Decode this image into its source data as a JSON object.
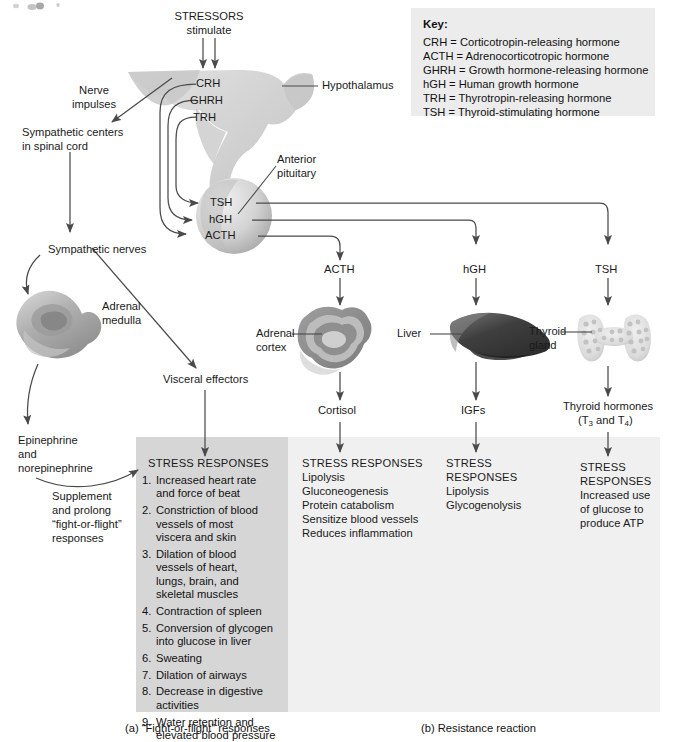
{
  "figure": {
    "title_hidden": "",
    "key": {
      "heading": "Key:",
      "entries": [
        "CRH = Corticotropin-releasing hormone",
        "ACTH = Adrenocorticotropic hormone",
        "GHRH = Growth hormone-releasing hormone",
        "hGH = Human growth hormone",
        "TRH = Thyrotropin-releasing hormone",
        "TSH = Thyroid-stimulating hormone"
      ]
    },
    "captions": {
      "a": "(a) “Fight-or-flight” responses",
      "b": "(b) Resistance reaction"
    }
  },
  "top": {
    "stressors": "STRESSORS",
    "stimulate": "stimulate"
  },
  "brain": {
    "hypothalamus": "Hypothalamus",
    "anterior_pituitary_l1": "Anterior",
    "anterior_pituitary_l2": "pituitary",
    "releasing_hormones": [
      "CRH",
      "GHRH",
      "TRH"
    ],
    "pituitary_hormones": [
      "TSH",
      "hGH",
      "ACTH"
    ]
  },
  "left_path": {
    "nerve_impulses_l1": "Nerve",
    "nerve_impulses_l2": "impulses",
    "sympathetic_centers_l1": "Sympathetic centers",
    "sympathetic_centers_l2": "in spinal cord",
    "sympathetic_nerves": "Sympathetic nerves",
    "adrenal_medulla_l1": "Adrenal",
    "adrenal_medulla_l2": "medulla",
    "epinephrine_l1": "Epinephrine",
    "epinephrine_l2": "and",
    "epinephrine_l3": "norepinephrine",
    "supplement_l1": "Supplement",
    "supplement_l2": "and prolong",
    "supplement_l3": "“fight-or-flight”",
    "supplement_l4": "responses",
    "visceral_effectors": "Visceral effectors"
  },
  "panel_a": {
    "heading": "STRESS RESPONSES",
    "items": [
      {
        "n": "1.",
        "text": "Increased heart rate\nand force of beat"
      },
      {
        "n": "2.",
        "text": "Constriction of blood\nvessels of most\nviscera and skin"
      },
      {
        "n": "3.",
        "text": "Dilation of blood\nvessels of heart,\nlungs, brain, and\nskeletal muscles"
      },
      {
        "n": "4.",
        "text": "Contraction of spleen"
      },
      {
        "n": "5.",
        "text": "Conversion of glycogen\ninto glucose in liver"
      },
      {
        "n": "6.",
        "text": "Sweating"
      },
      {
        "n": "7.",
        "text": "Dilation of airways"
      },
      {
        "n": "8.",
        "text": "Decrease in digestive\nactivities"
      },
      {
        "n": "9.",
        "text": "Water retention and\nelevated blood pressure"
      }
    ]
  },
  "columns": [
    {
      "hormone": "ACTH",
      "organ_label_l1": "Adrenal",
      "organ_label_l2": "cortex",
      "product": "Cortisol",
      "responses_heading_l1": "STRESS RESPONSES",
      "responses_heading_l2": "",
      "responses": [
        "Lipolysis",
        "Gluconeogenesis",
        "Protein catabolism",
        "Sensitize blood vessels",
        "Reduces inflammation"
      ]
    },
    {
      "hormone": "hGH",
      "organ_label_l1": "Liver",
      "organ_label_l2": "",
      "product": "IGFs",
      "responses_heading_l1": "STRESS",
      "responses_heading_l2": "RESPONSES",
      "responses": [
        "Lipolysis",
        "Glycogenolysis"
      ]
    },
    {
      "hormone": "TSH",
      "organ_label_l1": "Thyroid",
      "organ_label_l2": "gland",
      "product_l1": "Thyroid hormones",
      "product_l2": "(T3 and T4)",
      "responses_heading_l1": "STRESS",
      "responses_heading_l2": "RESPONSES",
      "responses": [
        "Increased use",
        "of glucose to",
        "produce ATP"
      ]
    }
  ],
  "colors": {
    "panel_a_bg": "#d6d6d6",
    "panel_b_bg": "#f0f0f0",
    "key_bg": "#ececec",
    "line": "#4a4a4a",
    "text": "#111111"
  }
}
